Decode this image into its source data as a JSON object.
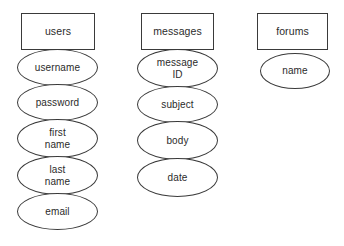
{
  "diagram": {
    "type": "entity-relationship-diagram",
    "background_color": "#ffffff",
    "stroke_color": "#3a3a3a",
    "text_color": "#2b2b2b",
    "entities": [
      {
        "name": "users",
        "box": {
          "x": 21,
          "y": 13,
          "w": 74,
          "h": 37
        },
        "attributes": [
          {
            "label": "username",
            "x": 17,
            "y": 49,
            "w": 81,
            "h": 37
          },
          {
            "label": "password",
            "x": 17,
            "y": 84,
            "w": 81,
            "h": 37
          },
          {
            "label": "first\nname",
            "x": 17,
            "y": 119,
            "w": 81,
            "h": 39
          },
          {
            "label": "last\nname",
            "x": 17,
            "y": 156,
            "w": 81,
            "h": 39
          },
          {
            "label": "email",
            "x": 17,
            "y": 193,
            "w": 81,
            "h": 37
          }
        ]
      },
      {
        "name": "messages",
        "box": {
          "x": 141,
          "y": 13,
          "w": 73,
          "h": 37
        },
        "attributes": [
          {
            "label": "message\nID",
            "x": 137,
            "y": 49,
            "w": 81,
            "h": 39
          },
          {
            "label": "subject",
            "x": 137,
            "y": 86,
            "w": 81,
            "h": 37
          },
          {
            "label": "body",
            "x": 137,
            "y": 121,
            "w": 81,
            "h": 39
          },
          {
            "label": "date",
            "x": 137,
            "y": 158,
            "w": 81,
            "h": 39
          }
        ]
      },
      {
        "name": "forums",
        "box": {
          "x": 257,
          "y": 13,
          "w": 71,
          "h": 37
        },
        "attributes": [
          {
            "label": "name",
            "x": 260,
            "y": 53,
            "w": 70,
            "h": 36
          }
        ]
      }
    ]
  }
}
